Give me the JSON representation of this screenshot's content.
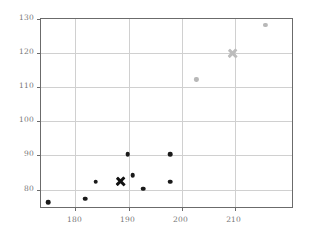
{
  "chart_data": {
    "type": "scatter",
    "title": "",
    "xlabel": "",
    "ylabel": "",
    "xlim": [
      173.5,
      221.2
    ],
    "ylim": [
      74.3,
      130.0
    ],
    "grid": true,
    "legend": "none",
    "xticks": [
      180,
      190,
      200,
      210
    ],
    "yticks": [
      80,
      90,
      100,
      110,
      120,
      130
    ],
    "series": [
      {
        "name": "dark-points",
        "marker": "circle",
        "color": "#1a1a1a",
        "points": [
          {
            "x": 175,
            "y": 76
          },
          {
            "x": 182,
            "y": 77
          },
          {
            "x": 184,
            "y": 82
          },
          {
            "x": 190,
            "y": 90
          },
          {
            "x": 191,
            "y": 84
          },
          {
            "x": 193,
            "y": 80
          },
          {
            "x": 198,
            "y": 90
          },
          {
            "x": 198,
            "y": 82
          }
        ]
      },
      {
        "name": "dark-centroid",
        "marker": "x",
        "color": "#111111",
        "points": [
          {
            "x": 188.6,
            "y": 82.2
          }
        ]
      },
      {
        "name": "light-points",
        "marker": "circle",
        "color": "#b8b8b8",
        "points": [
          {
            "x": 203,
            "y": 112
          },
          {
            "x": 216,
            "y": 128
          }
        ]
      },
      {
        "name": "light-centroid",
        "marker": "x",
        "color": "#bdbdbd",
        "points": [
          {
            "x": 209.7,
            "y": 119.7
          }
        ]
      }
    ]
  },
  "axis": {
    "frame_color": "#6b6b6b",
    "grid_color": "#d0d0d0",
    "tick_label_color": "#777777"
  }
}
